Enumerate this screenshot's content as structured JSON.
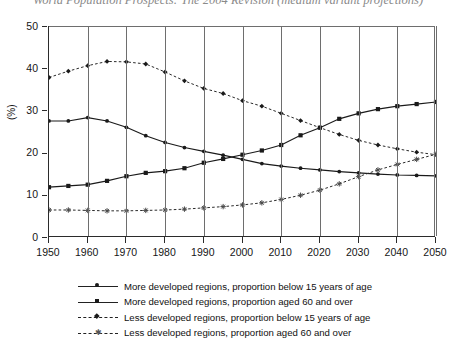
{
  "figure": {
    "title_partial": "World Population Prospects: The 2004 Revision (medium variant projections)",
    "ylabel": "(%)"
  },
  "chart_data": {
    "type": "line",
    "title": "World Population Prospects: The 2004 Revision (medium variant projections)",
    "xlabel": "",
    "ylabel": "(%)",
    "xlim": [
      1950,
      2050
    ],
    "ylim": [
      0,
      50
    ],
    "xticks": [
      1950,
      1960,
      1970,
      1980,
      1990,
      2000,
      2010,
      2020,
      2030,
      2040,
      2050
    ],
    "yticks": [
      0,
      10,
      20,
      30,
      40,
      50
    ],
    "grid": "vertical",
    "legend_position": "below",
    "x": [
      1950,
      1955,
      1960,
      1965,
      1970,
      1975,
      1980,
      1985,
      1990,
      1995,
      2000,
      2005,
      2010,
      2015,
      2020,
      2025,
      2030,
      2035,
      2040,
      2045,
      2050
    ],
    "series": [
      {
        "name": "More developed regions, proportion below 15 years of age",
        "style": "solid",
        "marker": "dot",
        "values": [
          27.5,
          27.5,
          28.3,
          27.5,
          26.0,
          24.0,
          22.4,
          21.2,
          20.3,
          19.4,
          18.4,
          17.4,
          16.8,
          16.3,
          15.9,
          15.5,
          15.2,
          14.9,
          14.7,
          14.6,
          14.5
        ]
      },
      {
        "name": "More developed regions, proportion aged 60 and over",
        "style": "solid",
        "marker": "square",
        "values": [
          11.8,
          12.1,
          12.4,
          13.3,
          14.4,
          15.2,
          15.6,
          16.3,
          17.6,
          18.5,
          19.5,
          20.5,
          21.8,
          24.1,
          25.9,
          28.0,
          29.3,
          30.3,
          31.0,
          31.5,
          32.0
        ]
      },
      {
        "name": "Less developed regions, proportion below 15 years of age",
        "style": "dashed",
        "marker": "diamond",
        "values": [
          37.8,
          39.3,
          40.6,
          41.6,
          41.5,
          41.0,
          39.1,
          37.0,
          35.2,
          34.0,
          32.3,
          31.0,
          29.3,
          27.6,
          25.9,
          24.3,
          22.9,
          21.8,
          20.9,
          20.1,
          19.5
        ]
      },
      {
        "name": "Less developed regions, proportion aged 60 and over",
        "style": "dashed",
        "marker": "star",
        "values": [
          6.4,
          6.4,
          6.3,
          6.2,
          6.2,
          6.3,
          6.4,
          6.6,
          6.9,
          7.2,
          7.6,
          8.1,
          8.9,
          9.9,
          11.1,
          12.6,
          14.3,
          15.9,
          17.2,
          18.4,
          19.6
        ]
      }
    ]
  },
  "legend": {
    "items": [
      {
        "label": "More developed regions, proportion below 15 years of age",
        "style": "solid",
        "marker": "dot"
      },
      {
        "label": "More developed regions, proportion aged 60 and over",
        "style": "solid",
        "marker": "square"
      },
      {
        "label": "Less developed regions, proportion below 15 years of age",
        "style": "dashed",
        "marker": "diamond"
      },
      {
        "label": "Less developed regions, proportion aged 60 and over",
        "style": "dashed",
        "marker": "star"
      }
    ]
  },
  "axes": {
    "x_tick_labels": [
      "1950",
      "1960",
      "1970",
      "1980",
      "1990",
      "2000",
      "2010",
      "2020",
      "2030",
      "2040",
      "2050"
    ],
    "y_tick_labels": [
      "0",
      "10",
      "20",
      "30",
      "40",
      "50"
    ]
  }
}
